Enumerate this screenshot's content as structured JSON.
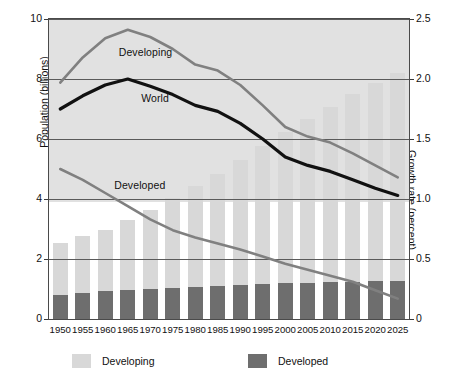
{
  "chart_data": {
    "type": "bar",
    "title": "",
    "subtitle": "",
    "categories": [
      "1950",
      "1955",
      "1960",
      "1965",
      "1970",
      "1975",
      "1980",
      "1985",
      "1990",
      "1995",
      "2000",
      "2005",
      "2010",
      "2015",
      "2020",
      "2025"
    ],
    "xlabel": "",
    "ylabel": "Population (billions)",
    "ylabel_right": "Growth rate (percent)",
    "ylim": [
      0,
      10
    ],
    "ylim_right": [
      0,
      2.5
    ],
    "yticks": [
      "0",
      "2",
      "4",
      "6",
      "8",
      "10"
    ],
    "yticks_right": [
      "0",
      "0.5",
      "1.0",
      "1.5",
      "2.0",
      "2.5"
    ],
    "grid": true,
    "legend_position": "bottom",
    "bar_mode": "stacked",
    "series": [
      {
        "name": "Developing",
        "kind": "bar",
        "axis": "left",
        "color": "#d8d8d8",
        "values": [
          1.72,
          1.91,
          2.05,
          2.32,
          2.62,
          2.97,
          3.35,
          3.73,
          4.15,
          4.6,
          5.05,
          5.45,
          5.85,
          6.25,
          6.62,
          6.95
        ]
      },
      {
        "name": "Developed",
        "kind": "bar",
        "axis": "left",
        "color": "#6e6e6e",
        "values": [
          0.81,
          0.86,
          0.92,
          0.97,
          1.01,
          1.05,
          1.08,
          1.11,
          1.14,
          1.17,
          1.19,
          1.21,
          1.23,
          1.25,
          1.26,
          1.26
        ]
      },
      {
        "name": "Developing",
        "kind": "line",
        "axis": "right",
        "color": "#808080",
        "values": [
          1.97,
          2.18,
          2.34,
          2.41,
          2.35,
          2.25,
          2.12,
          2.07,
          1.95,
          1.78,
          1.6,
          1.52,
          1.47,
          1.38,
          1.28,
          1.18
        ]
      },
      {
        "name": "World",
        "kind": "line",
        "axis": "right",
        "color": "#111111",
        "values": [
          1.75,
          1.86,
          1.95,
          2.0,
          1.94,
          1.87,
          1.78,
          1.73,
          1.63,
          1.5,
          1.35,
          1.28,
          1.23,
          1.16,
          1.09,
          1.03
        ]
      },
      {
        "name": "Developed",
        "kind": "line",
        "axis": "right",
        "color": "#808080",
        "values": [
          1.25,
          1.16,
          1.05,
          0.94,
          0.83,
          0.74,
          0.68,
          0.63,
          0.58,
          0.52,
          0.46,
          0.41,
          0.36,
          0.31,
          0.24,
          0.17
        ]
      }
    ],
    "annotations": [
      {
        "text": "Developing",
        "x": 1963,
        "y_right": 2.22
      },
      {
        "text": "World",
        "x": 1968,
        "y_right": 1.83
      },
      {
        "text": "Developed",
        "x": 1962,
        "y_right": 1.11
      }
    ]
  },
  "legend": {
    "items": [
      {
        "label": "Developing",
        "color": "#d8d8d8"
      },
      {
        "label": "Developed",
        "color": "#6e6e6e"
      }
    ]
  },
  "colors": {
    "developing_bar": "#d8d8d8",
    "developed_bar": "#6e6e6e",
    "line_gray": "#808080",
    "line_world": "#111111",
    "grid": "#5a5a5a",
    "frame": "#4a4a4a",
    "background": "#ffffff"
  }
}
